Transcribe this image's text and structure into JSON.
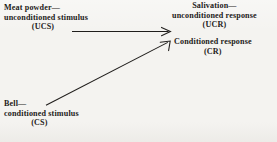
{
  "diagram": {
    "background_color": "#f4f3f0",
    "ink_color": "#201e1c",
    "nodes": [
      {
        "id": "ucs",
        "role": "unconditioned-stimulus",
        "lines": [
          "Meat powder—",
          "unconditioned stimulus",
          "(UCS)"
        ]
      },
      {
        "id": "ucr",
        "role": "unconditioned-response",
        "lines": [
          "Salivation—",
          "unconditioned response",
          "(UCR)"
        ]
      },
      {
        "id": "cr",
        "role": "conditioned-response",
        "lines": [
          "Conditioned response",
          "(CR)"
        ]
      },
      {
        "id": "cs",
        "role": "conditioned-stimulus",
        "lines": [
          "Bell—",
          "conditioned stimulus",
          "(CS)"
        ]
      }
    ],
    "arrows": [
      {
        "id": "ucs-to-ucr",
        "from": "ucs",
        "to": "ucr",
        "style": "horizontal-solid",
        "x1": 72,
        "y1": 31.5,
        "x2": 170,
        "y2": 31.5
      },
      {
        "id": "cs-to-cr",
        "from": "cs",
        "to": "cr",
        "style": "diagonal-solid",
        "x1": 46,
        "y1": 105,
        "x2": 170,
        "y2": 41
      }
    ]
  }
}
